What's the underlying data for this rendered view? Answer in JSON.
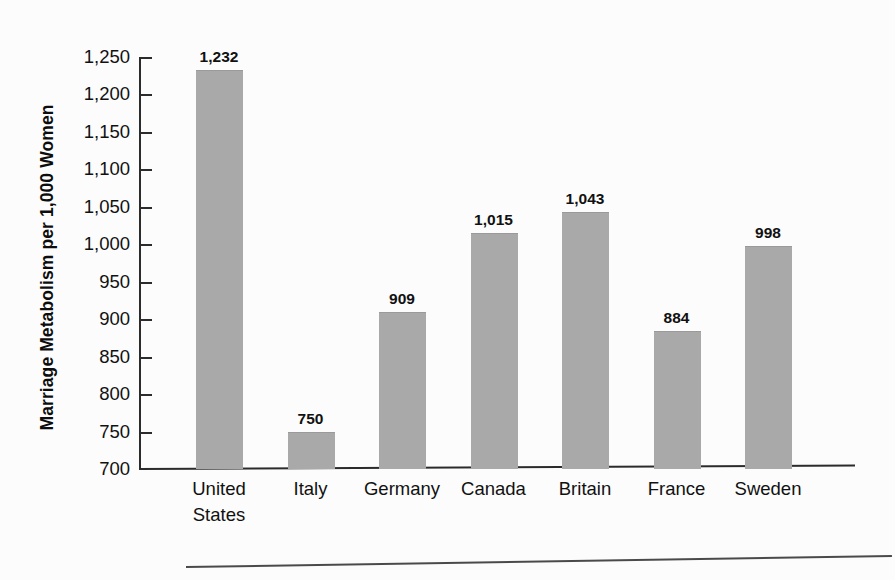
{
  "chart_data": {
    "type": "bar",
    "title": "",
    "xlabel": "",
    "ylabel": "Marriage Metabolism per 1,000 Women",
    "categories": [
      "United States",
      "Italy",
      "Germany",
      "Canada",
      "Britain",
      "France",
      "Sweden"
    ],
    "category_labels": [
      "United\nStates",
      "Italy",
      "Germany",
      "Canada",
      "Britain",
      "France",
      "Sweden"
    ],
    "values": [
      1232,
      750,
      909,
      1015,
      1043,
      884,
      998
    ],
    "value_labels": [
      "1,232",
      "750",
      "909",
      "1,015",
      "1,043",
      "884",
      "998"
    ],
    "ylim": [
      700,
      1250
    ],
    "ytick_values": [
      700,
      750,
      800,
      850,
      900,
      950,
      1000,
      1050,
      1100,
      1150,
      1200,
      1250
    ],
    "ytick_labels": [
      "700",
      "750",
      "800",
      "850",
      "900",
      "950",
      "1,000",
      "1,050",
      "1,100",
      "1,150",
      "1,200",
      "1,250"
    ],
    "grid": false,
    "legend": false,
    "legend_position": "none",
    "bar_color": "#a9a9a9",
    "axis_color": "#2b2b2b",
    "text_color": "#111111",
    "background_color": "#fcfcfc"
  }
}
